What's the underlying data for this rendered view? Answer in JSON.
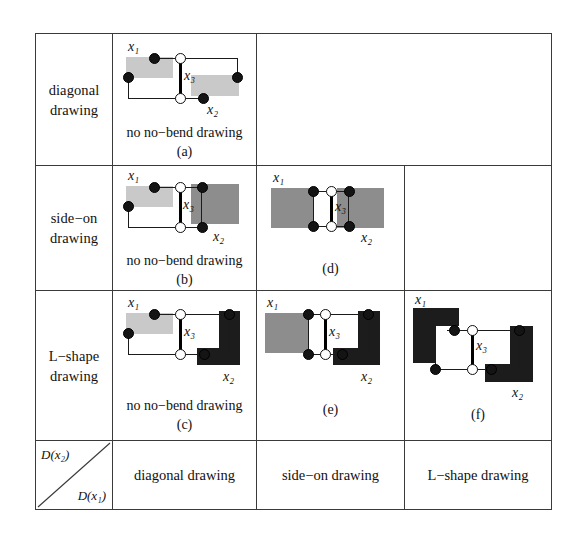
{
  "table": {
    "row_header_label": "D(x2)",
    "col_header_label": "D(x1)",
    "corner": {
      "upper_label": "D(x₂)",
      "lower_label": "D(x₁)"
    },
    "row_labels": [
      "diagonal drawing",
      "side−on drawing",
      "L−shape drawing"
    ],
    "column_labels": [
      "diagonal drawing",
      "side−on drawing",
      "L−shape drawing"
    ],
    "cells": [
      {
        "id": "a",
        "row": 0,
        "col": 0,
        "caption_note": "no no−bend drawing",
        "caption_tag": "(a)",
        "x1_style": "light-gray rectangle",
        "x2_style": "light-gray rectangle",
        "labels": {
          "x1": "x₁",
          "x2": "x₂",
          "x3": "x₃"
        }
      },
      {
        "id": "b",
        "row": 1,
        "col": 0,
        "caption_note": "no no−bend drawing",
        "caption_tag": "(b)",
        "x1_style": "light-gray rectangle",
        "x2_style": "mid-gray rectangle",
        "labels": {
          "x1": "x₁",
          "x2": "x₂",
          "x3": "x₃"
        }
      },
      {
        "id": "d",
        "row": 1,
        "col": 1,
        "caption_note": "",
        "caption_tag": "(d)",
        "x1_style": "mid-gray rectangle",
        "x2_style": "mid-gray rectangle",
        "labels": {
          "x1": "x₁",
          "x2": "x₂",
          "x3": "x₃"
        }
      },
      {
        "id": "c",
        "row": 2,
        "col": 0,
        "caption_note": "no no−bend drawing",
        "caption_tag": "(c)",
        "x1_style": "light-gray rectangle",
        "x2_style": "dark L-shape",
        "labels": {
          "x1": "x₁",
          "x2": "x₂",
          "x3": "x₃"
        }
      },
      {
        "id": "e",
        "row": 2,
        "col": 1,
        "caption_note": "",
        "caption_tag": "(e)",
        "x1_style": "mid-gray rectangle",
        "x2_style": "dark L-shape",
        "labels": {
          "x1": "x₁",
          "x2": "x₂",
          "x3": "x₃"
        }
      },
      {
        "id": "f",
        "row": 2,
        "col": 2,
        "caption_note": "",
        "caption_tag": "(f)",
        "x1_style": "dark L-shape",
        "x2_style": "dark L-shape",
        "labels": {
          "x1": "x₁",
          "x2": "x₂",
          "x3": "x₃"
        }
      }
    ]
  },
  "colors": {
    "light_gray": "#c9c9c9",
    "mid_gray": "#8d8d8d",
    "dark": "#1c1c1c",
    "line": "#3a3a3a",
    "background": "#ffffff"
  }
}
